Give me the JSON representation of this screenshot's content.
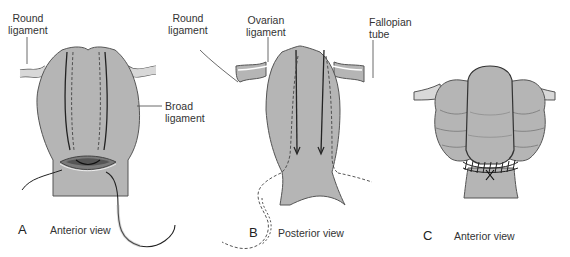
{
  "colors": {
    "tissue_fill": "#b5b5b5",
    "tissue_stroke": "#555555",
    "line": "#222222",
    "incision_dark": "#5a5a5a",
    "incision_mid": "#8a8a8a",
    "background": "#ffffff"
  },
  "panels": [
    {
      "letter": "A",
      "view": "Anterior view",
      "labels": {
        "round_ligament": [
          "Round",
          "ligament"
        ],
        "broad_ligament": [
          "Broad",
          "ligament"
        ]
      }
    },
    {
      "letter": "B",
      "view": "Posterior view",
      "labels": {
        "round_ligament": [
          "Round",
          "ligament"
        ],
        "ovarian_ligament": [
          "Ovarian",
          "ligament"
        ],
        "fallopian_tube": [
          "Fallopian",
          "tube"
        ]
      }
    },
    {
      "letter": "C",
      "view": "Anterior view",
      "labels": {}
    }
  ]
}
